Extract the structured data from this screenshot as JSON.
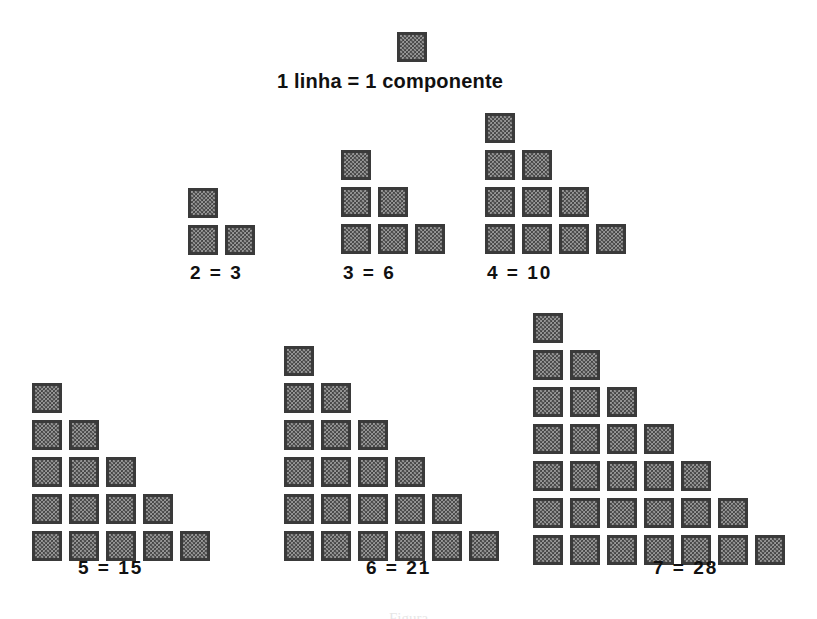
{
  "figure": {
    "title": "1 linha = 1 componente",
    "bottom_caption": "Figura",
    "background_color": "#ffffff",
    "square_fill_color": "#9a9a9a",
    "square_border_color": "#3a3a3a",
    "text_color": "#111111"
  },
  "legend_square": {
    "name": "unit-square",
    "x": 397,
    "y": 32
  },
  "groups": [
    {
      "id": "group-2",
      "label": "2  = 3",
      "lines": 2,
      "components": 3,
      "rows": [
        1,
        2
      ],
      "origin_x": 188,
      "origin_y": 188,
      "label_x": 190,
      "label_y": 262
    },
    {
      "id": "group-3",
      "label": "3  = 6",
      "lines": 3,
      "components": 6,
      "rows": [
        1,
        2,
        3
      ],
      "origin_x": 341,
      "origin_y": 150,
      "label_x": 343,
      "label_y": 262
    },
    {
      "id": "group-4",
      "label": "4  = 10",
      "lines": 4,
      "components": 10,
      "rows": [
        1,
        2,
        3,
        4
      ],
      "origin_x": 485,
      "origin_y": 113,
      "label_x": 487,
      "label_y": 262
    },
    {
      "id": "group-5",
      "label": "5  = 15",
      "lines": 5,
      "components": 15,
      "rows": [
        1,
        2,
        3,
        4,
        5
      ],
      "origin_x": 32,
      "origin_y": 383,
      "label_x": 78,
      "label_y": 557
    },
    {
      "id": "group-6",
      "label": "6  = 21",
      "lines": 6,
      "components": 21,
      "rows": [
        1,
        2,
        3,
        4,
        5,
        6
      ],
      "origin_x": 284,
      "origin_y": 346,
      "label_x": 366,
      "label_y": 557
    },
    {
      "id": "group-7",
      "label": "7  = 28",
      "lines": 7,
      "components": 28,
      "rows": [
        1,
        2,
        3,
        4,
        5,
        6,
        7
      ],
      "origin_x": 533,
      "origin_y": 313,
      "label_x": 653,
      "label_y": 557
    }
  ],
  "layout": {
    "square_size": 30,
    "pitch_x": 37,
    "pitch_y": 37,
    "title_x": 277,
    "title_y": 70
  },
  "chart_data": {
    "type": "bar",
    "title": "1 linha = 1 componente",
    "xlabel": "linhas",
    "ylabel": "componentes",
    "categories": [
      "1",
      "2",
      "3",
      "4",
      "5",
      "6",
      "7"
    ],
    "values": [
      1,
      3,
      6,
      10,
      15,
      21,
      28
    ],
    "series": [
      {
        "name": "componentes (numeros triangulares)",
        "values": [
          1,
          3,
          6,
          10,
          15,
          21,
          28
        ]
      }
    ],
    "annotations": [
      "1 linha = 1 componente",
      "2  = 3",
      "3  = 6",
      "4  = 10",
      "5  = 15",
      "6  = 21",
      "7  = 28"
    ],
    "grid": false,
    "legend": "none",
    "ylim": [
      0,
      28
    ]
  }
}
